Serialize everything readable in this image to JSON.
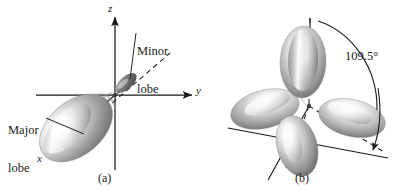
{
  "figure": {
    "kind": "orbital-diagram",
    "background_color": "#ffffff",
    "ink_color": "#1a1a1a",
    "width": 415,
    "height": 195
  },
  "panel_a": {
    "caption": "(a)",
    "description": "Single sp3 hybrid orbital with a large major lobe and a small minor lobe, drawn on x, y and z axes",
    "axes": [
      {
        "name": "z-axis",
        "label": "z",
        "direction": "up"
      },
      {
        "name": "y-axis",
        "label": "y",
        "direction": "right"
      },
      {
        "name": "x-axis",
        "label": "x",
        "direction": "down-left"
      }
    ],
    "callouts": [
      {
        "name": "minor-lobe",
        "line1": "Minor",
        "line2": "lobe"
      },
      {
        "name": "major-lobe",
        "line1": "Major",
        "line2": "lobe"
      }
    ],
    "lobes": [
      {
        "name": "major-lobe-shape",
        "size": "large",
        "points": "down-left"
      },
      {
        "name": "minor-lobe-shape",
        "size": "small",
        "points": "up-right"
      }
    ]
  },
  "panel_b": {
    "caption": "(b)",
    "description": "Four sp3 hybrid orbitals arranged tetrahedrally about a common origin",
    "angle": "109.5°",
    "lobes": [
      {
        "name": "lobe-top",
        "direction": "up"
      },
      {
        "name": "lobe-left",
        "direction": "left"
      },
      {
        "name": "lobe-right",
        "direction": "right"
      },
      {
        "name": "lobe-bottom",
        "direction": "down"
      }
    ],
    "arc": {
      "name": "angle-arc",
      "from": "vertical-axis",
      "to": "lower-right-axis"
    }
  }
}
